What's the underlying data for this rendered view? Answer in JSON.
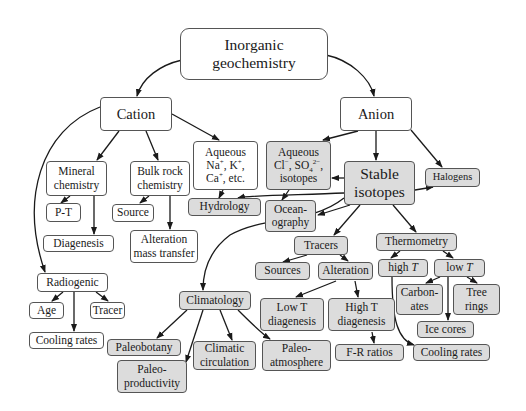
{
  "diagram": {
    "colors": {
      "plain_fill": "#ffffff",
      "shaded_fill": "#dcdcdc",
      "border": "#555555",
      "arrow": "#1a1a1a"
    },
    "nodes": {
      "root": "Inorganic\ngeochemistry",
      "cation": "Cation",
      "anion": "Anion",
      "mineral_chemistry": "Mineral\nchemistry",
      "bulk_rock_chemistry": "Bulk rock\nchemistry",
      "aqueous_cations_l1": "Aqueous",
      "aqueous_cations_l2": "Na+, K+,",
      "aqueous_cations_l3": "Ca+, etc.",
      "aqueous_anions_l1": "Aqueous",
      "aqueous_anions_l2": "Cl−, SO42−,",
      "aqueous_anions_l3": "isotopes",
      "stable_isotopes": "Stable\nisotopes",
      "halogens": "Halogens",
      "p_t": "P-T",
      "source": "Source",
      "hydrology": "Hydrology",
      "oceanography": "Ocean-\nography",
      "diagenesis": "Diagenesis",
      "alteration_mass_transfer": "Alteration\nmass transfer",
      "tracers": "Tracers",
      "sources": "Sources",
      "alteration": "Alteration",
      "thermometry": "Thermometry",
      "high_t": "high T",
      "low_t": "low T",
      "radiogenic": "Radiogenic",
      "age": "Age",
      "tracer": "Tracer",
      "climatology": "Climatology",
      "low_t_diagenesis": "Low T\ndiagenesis",
      "high_t_diagenesis": "High T\ndiagenesis",
      "carbonates": "Carbon-\nates",
      "tree_rings": "Tree\nrings",
      "cooling_rates_radiogenic": "Cooling rates",
      "paleobotany": "Paleobotany",
      "climatic_circulation": "Climatic\ncirculation",
      "paleo_atmosphere": "Paleo-\natmosphere",
      "f_r_ratios": "F-R ratios",
      "ice_cores": "Ice cores",
      "cooling_rates_thermometry": "Cooling rates",
      "paleo_productivity": "Paleo-\nproductivity"
    },
    "edges": [
      [
        "Inorganic geochemistry",
        "Cation"
      ],
      [
        "Inorganic geochemistry",
        "Anion"
      ],
      [
        "Cation",
        "Mineral chemistry"
      ],
      [
        "Cation",
        "Bulk rock chemistry"
      ],
      [
        "Cation",
        "Aqueous Na+, K+, Ca+, etc."
      ],
      [
        "Cation",
        "Radiogenic"
      ],
      [
        "Anion",
        "Aqueous Cl-, SO4 2-, isotopes"
      ],
      [
        "Anion",
        "Stable isotopes"
      ],
      [
        "Anion",
        "Halogens"
      ],
      [
        "Mineral chemistry",
        "P-T"
      ],
      [
        "Mineral chemistry",
        "Diagenesis"
      ],
      [
        "Bulk rock chemistry",
        "Source"
      ],
      [
        "Bulk rock chemistry",
        "Alteration mass transfer"
      ],
      [
        "Aqueous Na+, K+, Ca+, etc.",
        "Hydrology"
      ],
      [
        "Aqueous Cl-, SO4 2-, isotopes",
        "Oceanography"
      ],
      [
        "Stable isotopes",
        "Aqueous Cl-, SO4 2-, isotopes"
      ],
      [
        "Stable isotopes",
        "Hydrology"
      ],
      [
        "Stable isotopes",
        "Oceanography"
      ],
      [
        "Stable isotopes",
        "Halogens"
      ],
      [
        "Stable isotopes",
        "Tracers"
      ],
      [
        "Stable isotopes",
        "Climatology"
      ],
      [
        "Stable isotopes",
        "Thermometry"
      ],
      [
        "Tracers",
        "Sources"
      ],
      [
        "Tracers",
        "Alteration"
      ],
      [
        "Alteration",
        "Low T diagenesis"
      ],
      [
        "Alteration",
        "High T diagenesis"
      ],
      [
        "High T diagenesis",
        "F-R ratios"
      ],
      [
        "Thermometry",
        "high T"
      ],
      [
        "Thermometry",
        "low T"
      ],
      [
        "high T",
        "Cooling rates"
      ],
      [
        "low T",
        "Carbonates"
      ],
      [
        "low T",
        "Tree rings"
      ],
      [
        "low T",
        "Ice cores"
      ],
      [
        "Radiogenic",
        "Age"
      ],
      [
        "Radiogenic",
        "Tracer"
      ],
      [
        "Radiogenic",
        "Cooling rates"
      ],
      [
        "Climatology",
        "Paleobotany"
      ],
      [
        "Climatology",
        "Paleo-productivity"
      ],
      [
        "Climatology",
        "Climatic circulation"
      ],
      [
        "Climatology",
        "Paleo-atmosphere"
      ]
    ]
  }
}
